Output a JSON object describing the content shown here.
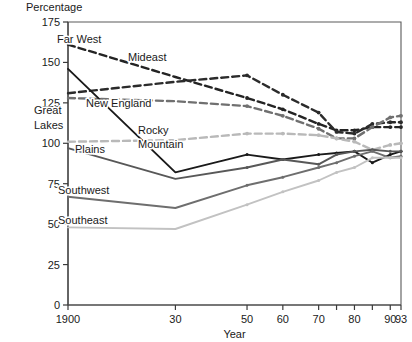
{
  "chart_data": {
    "type": "line",
    "title": "",
    "ylabel": "Percentage",
    "xlabel": "Year",
    "ylim": [
      0,
      175
    ],
    "yticks": [
      0,
      25,
      50,
      75,
      100,
      125,
      150,
      175
    ],
    "ytick_labels": [
      "0",
      "25",
      "50",
      "75",
      "100",
      "125",
      "150",
      "175"
    ],
    "xlim": [
      1900,
      1993
    ],
    "xticks": [
      1900,
      1930,
      1950,
      1960,
      1970,
      1975,
      1980,
      1985,
      1990,
      1993
    ],
    "xtick_labels": [
      "1900",
      "30",
      "",
      "50",
      "60",
      "70",
      "",
      "80",
      "",
      "90",
      "93"
    ],
    "xtick_labeled": [
      {
        "year": 1900,
        "label": "1900"
      },
      {
        "year": 1930,
        "label": "30"
      },
      {
        "year": 1950,
        "label": "50"
      },
      {
        "year": 1960,
        "label": "60"
      },
      {
        "year": 1970,
        "label": "70"
      },
      {
        "year": 1975,
        "label": ""
      },
      {
        "year": 1980,
        "label": "80"
      },
      {
        "year": 1985,
        "label": ""
      },
      {
        "year": 1990,
        "label": "90"
      },
      {
        "year": 1993,
        "label": "93"
      }
    ],
    "grid": false,
    "legend_position": "inline-annotations",
    "series": [
      {
        "name": "Far West",
        "color": "#242424",
        "style": "dashed",
        "x": [
          1900,
          1930,
          1950,
          1960,
          1970,
          1975,
          1980,
          1985,
          1990,
          1993
        ],
        "values": [
          161,
          141,
          128,
          121,
          112,
          108,
          108,
          110,
          110,
          110
        ]
      },
      {
        "name": "Mideast",
        "color": "#2b2b2b",
        "style": "dashed",
        "x": [
          1900,
          1930,
          1950,
          1960,
          1970,
          1975,
          1980,
          1985,
          1990,
          1993
        ],
        "values": [
          131,
          138,
          142,
          130,
          119,
          107,
          106,
          112,
          113,
          113
        ]
      },
      {
        "name": "New England",
        "color": "#707070",
        "style": "dashed",
        "x": [
          1900,
          1930,
          1950,
          1960,
          1970,
          1975,
          1980,
          1985,
          1990,
          1993
        ],
        "values": [
          128,
          126,
          123,
          117,
          109,
          103,
          103,
          110,
          116,
          117
        ]
      },
      {
        "name": "Great Lakes",
        "color": "#b9b9b9",
        "style": "dashed",
        "x": [
          1900,
          1930,
          1950,
          1960,
          1970,
          1975,
          1980,
          1985,
          1990,
          1993
        ],
        "values": [
          101,
          102,
          106,
          106,
          105,
          103,
          101,
          96,
          99,
          100
        ]
      },
      {
        "name": "Rocky Mountain",
        "color": "#1a1a1a",
        "style": "solid",
        "x": [
          1900,
          1930,
          1950,
          1960,
          1970,
          1975,
          1980,
          1985,
          1990,
          1993
        ],
        "values": [
          146,
          82,
          93,
          90,
          93,
          94,
          95,
          88,
          93,
          95
        ]
      },
      {
        "name": "Plains",
        "color": "#585858",
        "style": "solid",
        "x": [
          1900,
          1930,
          1950,
          1960,
          1970,
          1975,
          1980,
          1985,
          1990,
          1993
        ],
        "values": [
          97,
          78,
          85,
          90,
          87,
          93,
          95,
          96,
          95,
          95
        ]
      },
      {
        "name": "Southwest",
        "color": "#6e6e6e",
        "style": "solid",
        "x": [
          1900,
          1930,
          1950,
          1960,
          1970,
          1975,
          1980,
          1985,
          1990,
          1993
        ],
        "values": [
          67,
          60,
          74,
          79,
          85,
          88,
          92,
          95,
          91,
          92
        ]
      },
      {
        "name": "Southeast",
        "color": "#c2c2c2",
        "style": "solid",
        "x": [
          1900,
          1930,
          1950,
          1960,
          1970,
          1975,
          1980,
          1985,
          1990,
          1993
        ],
        "values": [
          48,
          47,
          62,
          70,
          77,
          82,
          85,
          91,
          91,
          91
        ]
      }
    ],
    "annotations": [
      {
        "text": "Far West",
        "x_px": 57,
        "y_px": 43,
        "align": "start"
      },
      {
        "text": "Mideast",
        "x_px": 128,
        "y_px": 61,
        "align": "start"
      },
      {
        "text": "New England",
        "x_px": 86,
        "y_px": 107,
        "align": "start"
      },
      {
        "text": "Great",
        "x_px": 34,
        "y_px": 114,
        "align": "start"
      },
      {
        "text": "Lakes",
        "x_px": 34,
        "y_px": 129,
        "align": "start"
      },
      {
        "text": "Rocky",
        "x_px": 138,
        "y_px": 134,
        "align": "start"
      },
      {
        "text": "Mountain",
        "x_px": 138,
        "y_px": 148,
        "align": "start"
      },
      {
        "text": "Plains",
        "x_px": 75,
        "y_px": 153,
        "align": "start"
      },
      {
        "text": "Southwest",
        "x_px": 58,
        "y_px": 194,
        "align": "start"
      },
      {
        "text": "Southeast",
        "x_px": 58,
        "y_px": 224,
        "align": "start"
      }
    ]
  }
}
